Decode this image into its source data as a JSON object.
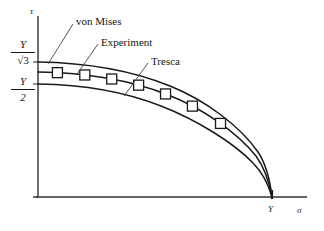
{
  "figure": {
    "kind": "yield-locus-plot",
    "background_color": "#ffffff",
    "line_color": "#1a1a1a"
  },
  "axes": {
    "y_axis_symbol": "τ",
    "x_axis_symbol": "σ",
    "x_tick_label": "Y",
    "y_tick_upper": {
      "numerator": "Y",
      "denominator": "√3"
    },
    "y_tick_lower": {
      "numerator": "Y",
      "denominator": "2"
    }
  },
  "labels": {
    "von_mises": "von Mises",
    "experiment": "Experiment",
    "tresca": "Tresca"
  },
  "chart_data": {
    "type": "line",
    "title": "",
    "xlabel": "σ",
    "ylabel": "τ",
    "grid": false,
    "legend": "inline-annotations",
    "xlim": [
      0,
      1.12
    ],
    "ylim": [
      0,
      0.72
    ],
    "x_ticks": [
      {
        "value": 1.0,
        "label": "Y"
      }
    ],
    "y_ticks": [
      {
        "value": 0.5774,
        "label": "Y/√3"
      },
      {
        "value": 0.5,
        "label": "Y/2"
      }
    ],
    "series": [
      {
        "name": "von Mises",
        "style": "solid",
        "marker": "none",
        "x": [
          0.0,
          0.1,
          0.2,
          0.3,
          0.4,
          0.5,
          0.6,
          0.7,
          0.8,
          0.85,
          0.9,
          0.94,
          0.97,
          0.99,
          1.0
        ],
        "y": [
          0.5774,
          0.5745,
          0.5657,
          0.5508,
          0.5292,
          0.5,
          0.4619,
          0.4124,
          0.3464,
          0.3042,
          0.2517,
          0.197,
          0.1403,
          0.0814,
          0.0
        ]
      },
      {
        "name": "Experiment",
        "style": "solid",
        "marker": "square",
        "x": [
          0.0,
          0.1,
          0.2,
          0.3,
          0.4,
          0.5,
          0.6,
          0.7,
          0.8,
          0.85,
          0.9,
          0.94,
          0.97,
          0.99,
          1.0
        ],
        "y": [
          0.54,
          0.5372,
          0.529,
          0.5151,
          0.495,
          0.4678,
          0.4322,
          0.3858,
          0.324,
          0.2845,
          0.2354,
          0.1843,
          0.1312,
          0.0761,
          0.0
        ],
        "marker_points": [
          {
            "x": 0.083,
            "y": 0.5385
          },
          {
            "x": 0.2,
            "y": 0.529
          },
          {
            "x": 0.315,
            "y": 0.5128
          },
          {
            "x": 0.43,
            "y": 0.4876
          },
          {
            "x": 0.545,
            "y": 0.4521
          },
          {
            "x": 0.66,
            "y": 0.4045
          },
          {
            "x": 0.78,
            "y": 0.338
          }
        ]
      },
      {
        "name": "Tresca",
        "style": "solid",
        "marker": "none",
        "x": [
          0.0,
          0.1,
          0.2,
          0.3,
          0.4,
          0.5,
          0.6,
          0.7,
          0.8,
          0.85,
          0.9,
          0.94,
          0.97,
          0.99,
          1.0
        ],
        "y": [
          0.5,
          0.4975,
          0.4899,
          0.477,
          0.4583,
          0.433,
          0.4,
          0.3571,
          0.3,
          0.2634,
          0.2179,
          0.1706,
          0.1215,
          0.0705,
          0.0
        ]
      }
    ],
    "annotations": [
      {
        "text": "von Mises",
        "leader_from": [
          0.415,
          0.705
        ],
        "leader_to": [
          0.125,
          0.562
        ]
      },
      {
        "text": "Experiment",
        "leader_from": [
          0.52,
          0.615
        ],
        "leader_to": [
          0.3,
          0.498
        ]
      },
      {
        "text": "Tresca",
        "leader_from": [
          0.7,
          0.538
        ],
        "leader_to": [
          0.47,
          0.42
        ]
      }
    ]
  }
}
